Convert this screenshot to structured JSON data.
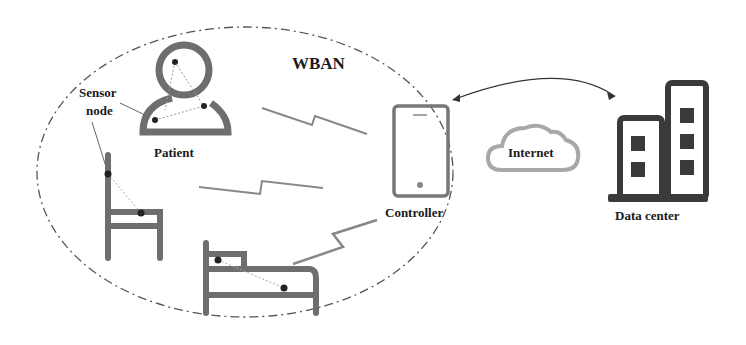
{
  "diagram": {
    "title": "WBAN",
    "labels": {
      "sensor_node": [
        "Sensor",
        "node"
      ],
      "patient": "Patient",
      "controller": "Controller",
      "internet": "Internet",
      "data_center": "Data center"
    },
    "icons": [
      "patient-icon",
      "chair-icon",
      "bed-icon",
      "smartphone-controller-icon",
      "cloud-icon",
      "building-icon",
      "wireless-link-icon",
      "sensor-dot-icon"
    ],
    "colors": {
      "stroke_gray": "#6e6e6e",
      "dark_building": "#3a3a3a",
      "cloud_gray": "#a8a8a8",
      "text": "#1a1a1a",
      "background": "#ffffff"
    }
  }
}
